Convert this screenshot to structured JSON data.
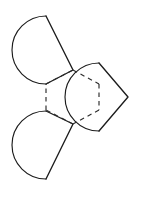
{
  "figure": {
    "canvas": {
      "width": 168,
      "height": 197,
      "background": "#ffffff"
    },
    "style": {
      "stroke_color": "#1c1c1c",
      "dash_color": "#2b2b2b",
      "fill": "none",
      "solid_stroke_width": 1.15,
      "wedge_stroke_width": 1.35,
      "dash_stroke_width": 1.15,
      "dash_pattern": "4.5 4.0"
    },
    "hexagon": {
      "name": "central-dashed-hexagon",
      "dashed": true,
      "vertices": [
        {
          "label": "top",
          "x": 73,
          "y": 70
        },
        {
          "label": "upper-right",
          "x": 99,
          "y": 84
        },
        {
          "label": "lower-right",
          "x": 99,
          "y": 110
        },
        {
          "label": "bottom",
          "x": 73,
          "y": 124
        },
        {
          "label": "lower-left",
          "x": 46,
          "y": 110
        },
        {
          "label": "upper-left",
          "x": 46,
          "y": 84
        }
      ],
      "center": {
        "x": 72.5,
        "y": 97
      }
    },
    "circles": [
      {
        "name": "top-left-circle",
        "center": {
          "x": 46,
          "y": 50
        },
        "radius": 34,
        "wedge": {
          "name": "top-left-wedge",
          "apex": {
            "x": 73,
            "y": 70
          },
          "arm_a": {
            "x": 46,
            "y": 16
          },
          "arm_b": {
            "x": 46,
            "y": 84
          },
          "direction": "points-right"
        }
      },
      {
        "name": "right-circle",
        "center": {
          "x": 99,
          "y": 97
        },
        "radius": 34,
        "wedge": {
          "name": "right-wedge",
          "apex": {
            "x": 128,
            "y": 97
          },
          "arm_a": {
            "x": 99,
            "y": 84
          },
          "arm_b": {
            "x": 99,
            "y": 110
          },
          "direction": "points-right"
        }
      },
      {
        "name": "bottom-left-circle",
        "center": {
          "x": 46,
          "y": 145
        },
        "radius": 34,
        "wedge": {
          "name": "bottom-left-wedge",
          "apex": {
            "x": 73,
            "y": 124
          },
          "arm_a": {
            "x": 46,
            "y": 110
          },
          "arm_b": {
            "x": 46,
            "y": 179
          },
          "direction": "points-right"
        }
      }
    ]
  }
}
